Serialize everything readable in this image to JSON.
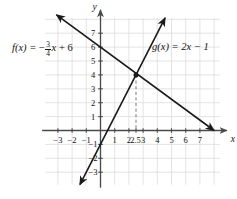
{
  "figure": {
    "background_color": "#ffffff",
    "grid_color": "#dcdcdc",
    "axis_color": "#4a4a4a",
    "curve_color": "#1a1a1a",
    "dashed_color": "#7a7a7a"
  },
  "axes": {
    "x_axis_label": "x",
    "y_axis_label": "y",
    "x_ticks": [
      {
        "value": -3,
        "label": "−3"
      },
      {
        "value": -2,
        "label": "−2"
      },
      {
        "value": -1,
        "label": "−1"
      },
      {
        "value": 1,
        "label": "1"
      },
      {
        "value": 2,
        "label": "2"
      },
      {
        "value": 3,
        "label": "3"
      },
      {
        "value": 4,
        "label": "4"
      },
      {
        "value": 5,
        "label": "5"
      },
      {
        "value": 6,
        "label": "6"
      },
      {
        "value": 7,
        "label": "7"
      }
    ],
    "y_ticks": [
      {
        "value": 7,
        "label": "7"
      },
      {
        "value": 6,
        "label": "6"
      },
      {
        "value": 5,
        "label": "5"
      },
      {
        "value": 4,
        "label": "4"
      },
      {
        "value": 3,
        "label": "3"
      },
      {
        "value": 2,
        "label": "2"
      },
      {
        "value": 1,
        "label": "1"
      },
      {
        "value": -1,
        "label": "−1"
      },
      {
        "value": -2,
        "label": "−2"
      },
      {
        "value": -3,
        "label": "−3"
      }
    ],
    "xlim": [
      -3.9,
      8.4
    ],
    "ylim": [
      -3.9,
      8.1
    ],
    "grid": true
  },
  "annotations": {
    "intersection_x_marker": "2.5",
    "intersection_point": {
      "x": 2.5,
      "y": 4
    },
    "dashed_dropline": true,
    "point_marker": "filled-dot"
  },
  "labels": {
    "f": {
      "lhs": "f(x) = ",
      "sign": "−",
      "numerator": "3",
      "denominator": "4",
      "variable": "x",
      "tail": " + 6"
    },
    "g": {
      "text": "g(x) = 2x − 1"
    }
  },
  "chart_data": {
    "type": "line",
    "title": "",
    "xlabel": "x",
    "ylabel": "y",
    "xlim": [
      -3.9,
      8.4
    ],
    "ylim": [
      -3.9,
      8.1
    ],
    "grid": true,
    "legend": "inline-labels",
    "series": [
      {
        "name": "f(x) = -3/4x + 6",
        "slope": -0.75,
        "intercept": 6,
        "color": "#1a1a1a",
        "arrows": [
          "both"
        ],
        "points": [
          {
            "x": -3.1,
            "y": 8.325
          },
          {
            "x": 8.0,
            "y": 0.0
          }
        ]
      },
      {
        "name": "g(x) = 2x - 1",
        "slope": 2,
        "intercept": -1,
        "color": "#1a1a1a",
        "arrows": [
          "both"
        ],
        "points": [
          {
            "x": -1.45,
            "y": -3.9
          },
          {
            "x": 4.55,
            "y": 8.1
          }
        ]
      }
    ],
    "intersection": {
      "x": 2.5,
      "y": 4
    }
  }
}
